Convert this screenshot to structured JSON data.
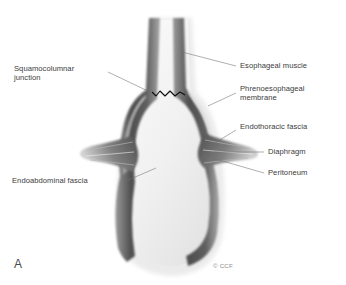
{
  "figure": {
    "panel_letter": "A",
    "copyright": "© CCF",
    "background_color": "#ffffff",
    "text_color": "#3b3b3b"
  },
  "labels": {
    "squamocolumnar_junction": "Squamocolumnar\njunction",
    "endoabdominal_fascia": "Endoabdominal fascia",
    "esophageal_muscle": "Esophageal muscle",
    "phrenoesophageal_membrane": "Phrenoesophageal\nmembrane",
    "endothoracic_fascia": "Endothoracic fascia",
    "diaphragm": "Diaphragm",
    "peritoneum": "Peritoneum"
  },
  "anatomy": {
    "muscle_color": "#5e5e5e",
    "lumen_color": "#f2f2f2",
    "membrane_color": "#c9c9c9",
    "zline_color": "#111111",
    "leader_color": "#6e6e6e"
  }
}
